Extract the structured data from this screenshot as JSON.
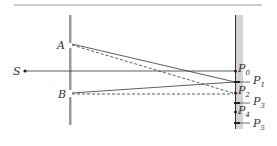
{
  "diagram": {
    "labels": {
      "source": "S",
      "slit_a": "A",
      "slit_b": "B",
      "points": [
        {
          "name": "P",
          "sub": "0"
        },
        {
          "name": "P",
          "sub": "1"
        },
        {
          "name": "P",
          "sub": "2"
        },
        {
          "name": "P",
          "sub": "3"
        },
        {
          "name": "P",
          "sub": "4"
        },
        {
          "name": "P",
          "sub": "5"
        }
      ]
    },
    "colors": {
      "line": "#333333",
      "barrier": "#9a9a9a",
      "screen_band": "#d4d4d4"
    }
  }
}
